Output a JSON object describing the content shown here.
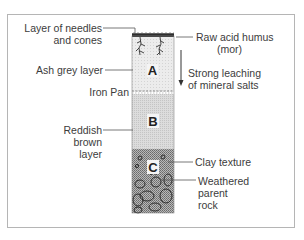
{
  "diagram": {
    "horizons": [
      {
        "letter": "A",
        "name": "Ash grey layer"
      },
      {
        "letter": "B",
        "name": "Reddish brown layer"
      },
      {
        "letter": "C",
        "name": "Weathered parent rock"
      }
    ],
    "labels": {
      "needles_line1": "Layer of needles",
      "needles_line2": "and cones",
      "ash_grey": "Ash grey layer",
      "iron_pan": "Iron Pan",
      "reddish_line1": "Reddish",
      "reddish_line2": "brown",
      "reddish_line3": "layer",
      "humus_line1": "Raw acid humus",
      "humus_line2": "(mor)",
      "leaching_line1": "Strong leaching",
      "leaching_line2": "of mineral salts",
      "clay": "Clay texture",
      "weathered_line1": "Weathered",
      "weathered_line2": "parent",
      "weathered_line3": "rock"
    },
    "colors": {
      "line": "#444444",
      "horizon_a": "#e6e6e6",
      "horizon_b": "#d6d6d6",
      "horizon_c": "#9a9a9a"
    }
  }
}
